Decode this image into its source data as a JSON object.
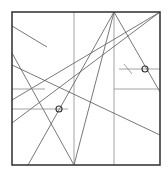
{
  "diagram": {
    "type": "geometric-construction",
    "frame": {
      "x1": 12,
      "y1": 12,
      "x2": 160,
      "y2": 165
    },
    "lines": [
      {
        "id": "vertical-left",
        "x1": 74,
        "y1": 12,
        "x2": 74,
        "y2": 165,
        "style": "light"
      },
      {
        "id": "vertical-right",
        "x1": 114,
        "y1": 12,
        "x2": 114,
        "y2": 165,
        "style": "light"
      },
      {
        "id": "short-diagonal-top-left",
        "x1": 12,
        "y1": 26,
        "x2": 47,
        "y2": 47,
        "style": "normal"
      },
      {
        "id": "apex-to-bottom-mid",
        "x1": 114,
        "y1": 12,
        "x2": 74,
        "y2": 165,
        "style": "normal"
      },
      {
        "id": "apex-to-bottom-left",
        "x1": 114,
        "y1": 12,
        "x2": 28,
        "y2": 165,
        "style": "normal"
      },
      {
        "id": "apex-to-right-edge",
        "x1": 114,
        "y1": 12,
        "x2": 160,
        "y2": 92,
        "style": "normal"
      },
      {
        "id": "corner-to-left-upper",
        "x1": 160,
        "y1": 12,
        "x2": 12,
        "y2": 100,
        "style": "normal"
      },
      {
        "id": "corner-to-left-lower",
        "x1": 160,
        "y1": 12,
        "x2": 12,
        "y2": 123,
        "style": "normal"
      },
      {
        "id": "left-to-bottom-mid",
        "x1": 12,
        "y1": 53,
        "x2": 74,
        "y2": 165,
        "style": "normal"
      },
      {
        "id": "long-descending",
        "x1": 12,
        "y1": 65,
        "x2": 160,
        "y2": 135,
        "style": "normal"
      },
      {
        "id": "horizontal-left-upper",
        "x1": 12,
        "y1": 89,
        "x2": 45,
        "y2": 89,
        "style": "light"
      },
      {
        "id": "horizontal-left-lower",
        "x1": 12,
        "y1": 109,
        "x2": 68,
        "y2": 109,
        "style": "light"
      },
      {
        "id": "horizontal-right-upper",
        "x1": 119,
        "y1": 69,
        "x2": 160,
        "y2": 69,
        "style": "light"
      },
      {
        "id": "horizontal-right-lower",
        "x1": 114,
        "y1": 89,
        "x2": 160,
        "y2": 89,
        "style": "light"
      },
      {
        "id": "tick-mark-right",
        "x1": 124,
        "y1": 64,
        "x2": 132,
        "y2": 74,
        "style": "light"
      }
    ],
    "markers": [
      {
        "id": "circle-marker-left",
        "cx": 59,
        "cy": 109,
        "r": 3
      },
      {
        "id": "circle-marker-right",
        "cx": 145,
        "cy": 69,
        "r": 3
      }
    ]
  }
}
